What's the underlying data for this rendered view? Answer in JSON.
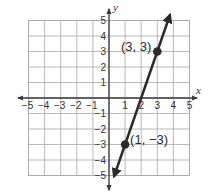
{
  "chart_data": {
    "type": "line",
    "title": "",
    "xlabel": "x",
    "ylabel": "y",
    "xlim": [
      -5,
      5
    ],
    "ylim": [
      -5,
      5
    ],
    "grid": true,
    "x_ticks": [
      -5,
      -4,
      -3,
      -2,
      -1,
      1,
      2,
      3,
      4,
      5
    ],
    "y_ticks": [
      -5,
      -4,
      -3,
      -2,
      -1,
      1,
      2,
      3,
      4,
      5
    ],
    "x_tick_labels": [
      "−5",
      "−4",
      "−3",
      "−2",
      "−1",
      "1",
      "2",
      "3",
      "4",
      "5"
    ],
    "y_tick_labels": [
      "−5",
      "−4",
      "−3",
      "−2",
      "−1",
      "1",
      "2",
      "3",
      "4",
      "5"
    ],
    "series": [
      {
        "name": "line",
        "equation": "y = 3x - 6",
        "slope": 3,
        "y_intercept": -6,
        "x_intercept": 2,
        "arrows": "both",
        "x_range": [
          0.33,
          3.77
        ],
        "color": "#2b2b2b"
      }
    ],
    "points": [
      {
        "x": 3,
        "y": 3,
        "label": "(3, 3)"
      },
      {
        "x": 1,
        "y": -3,
        "label": "(1, −3)"
      }
    ]
  },
  "colors": {
    "grid": "#a8a8a8",
    "axis": "#3a3a3a",
    "line": "#2b2b2b",
    "point": "#2b2b2b"
  }
}
